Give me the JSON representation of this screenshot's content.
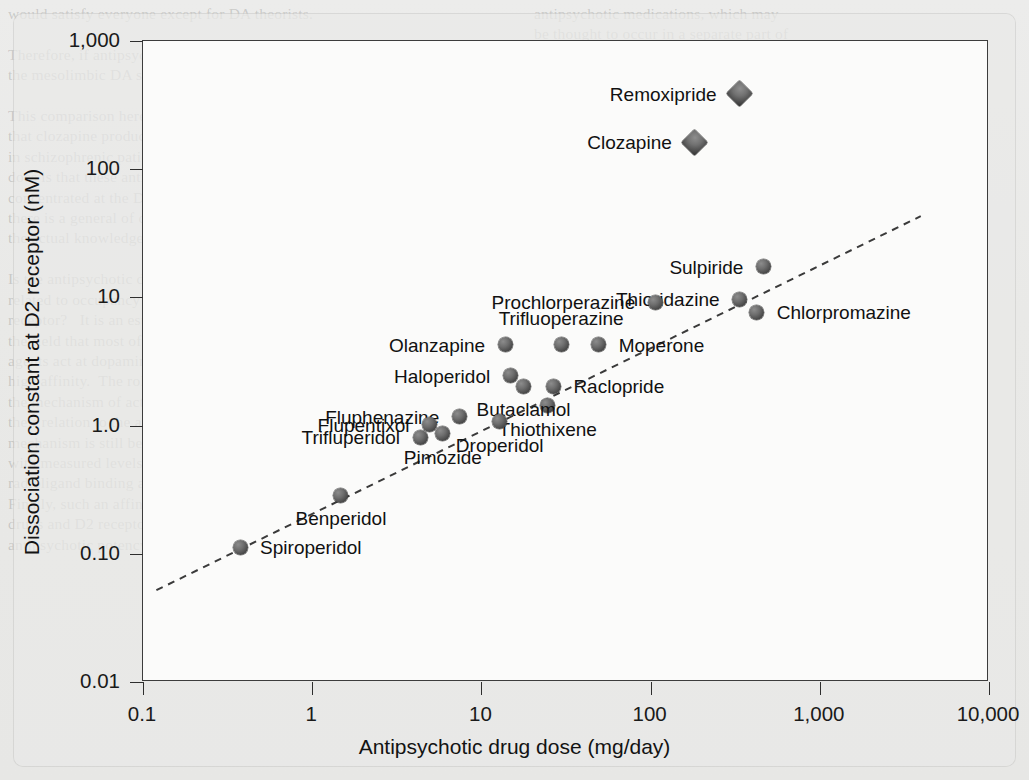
{
  "figure": {
    "background_color": "#e9e9e7",
    "plot_background_color": "#fbfbfa",
    "axis_color": "#2e2e2e",
    "marker_color": "#4a4a4a"
  },
  "chart_data": {
    "type": "scatter",
    "title": "",
    "xlabel": "Antipsychotic drug dose (mg/day)",
    "ylabel": "Dissociation constant at D2 receptor (nM)",
    "xscale": "log",
    "yscale": "log",
    "xlim": [
      0.1,
      10000
    ],
    "ylim": [
      0.01,
      1000
    ],
    "grid": false,
    "legend": "none",
    "xticks": [
      "0.1",
      "1",
      "10",
      "100",
      "1,000",
      "10,000"
    ],
    "xtick_values": [
      0.1,
      1,
      10,
      100,
      1000,
      10000
    ],
    "yticks": [
      "1,000",
      "100",
      "10",
      "1.0",
      "0.10",
      "0.01"
    ],
    "ytick_values": [
      1000,
      100,
      10,
      1.0,
      0.1,
      0.01
    ],
    "annotations": [
      {
        "name": "regression-line",
        "style": "dashed",
        "x0": 0.12,
        "y0": 0.052,
        "x1": 3950,
        "y1": 43
      }
    ],
    "points": [
      {
        "label": "Remoxipride",
        "x": 340,
        "y": 380,
        "marker": "diamond",
        "label_pos": "left"
      },
      {
        "label": "Clozapine",
        "x": 185,
        "y": 160,
        "marker": "diamond",
        "label_pos": "left"
      },
      {
        "label": "Sulpiride",
        "x": 470,
        "y": 17,
        "marker": "circle",
        "label_pos": "left"
      },
      {
        "label": "Thioridazine",
        "x": 340,
        "y": 9.5,
        "marker": "circle",
        "label_pos": "left"
      },
      {
        "label": "Chlorpromazine",
        "x": 430,
        "y": 7.5,
        "marker": "circle",
        "label_pos": "right"
      },
      {
        "label": "Prochlorperazine",
        "x": 108,
        "y": 9.0,
        "marker": "circle",
        "label_pos": "left"
      },
      {
        "label": "Moperone",
        "x": 50,
        "y": 4.2,
        "marker": "circle",
        "label_pos": "right"
      },
      {
        "label": "Trifluoperazine",
        "x": 30,
        "y": 4.2,
        "marker": "circle",
        "label_pos": "above"
      },
      {
        "label": "Olanzapine",
        "x": 14,
        "y": 4.2,
        "marker": "circle",
        "label_pos": "left"
      },
      {
        "label": "Raclopride",
        "x": 27,
        "y": 2.0,
        "marker": "circle",
        "label_pos": "right"
      },
      {
        "label": "Thiothixene",
        "x": 25,
        "y": 1.4,
        "marker": "circle",
        "label_pos": "below"
      },
      {
        "label": "Haloperidol",
        "x": 15,
        "y": 2.4,
        "marker": "circle",
        "label_pos": "left"
      },
      {
        "label": "Butaclamol",
        "x": 18,
        "y": 2.0,
        "marker": "circle",
        "label_pos": "below"
      },
      {
        "label": "Droperidol",
        "x": 13,
        "y": 1.05,
        "marker": "circle",
        "label_pos": "below"
      },
      {
        "label": "Fluphenazine",
        "x": 7.5,
        "y": 1.15,
        "marker": "circle",
        "label_pos": "left"
      },
      {
        "label": "Flupentixol",
        "x": 5.0,
        "y": 1.0,
        "marker": "circle",
        "label_pos": "left"
      },
      {
        "label": "Pimozide",
        "x": 6.0,
        "y": 0.85,
        "marker": "circle",
        "label_pos": "below"
      },
      {
        "label": "Trifluperidol",
        "x": 4.4,
        "y": 0.8,
        "marker": "circle",
        "label_pos": "left"
      },
      {
        "label": "Benperidol",
        "x": 1.5,
        "y": 0.28,
        "marker": "circle",
        "label_pos": "below"
      },
      {
        "label": "Spiroperidol",
        "x": 0.38,
        "y": 0.11,
        "marker": "circle",
        "label_pos": "right"
      }
    ]
  },
  "page_text": {
    "left_column": "would satisfy everyone except for DA theorists.\n\nTherefore, if antipsychotic drugs do not work through\nthe mesolimbic DA system, how do they work?\n\nThis comparison here does suggest\nthat clozapine produces and that it is\nin schizophrenic patient.  The reason above\ndoes is that these antipsychotic\nconcentrated at the D2 receptor and that\nthere is a general of drugs with\nthe actual knowledge of the D2 receptor.\n\nIs the antipsychotic drug effect\nrelated to occupancy of the dopamine D2\nreceptor?   It is an established consensus in\nthe field that most of the antipsychotic\nagents act at dopamine receptors with\nhigh affinity.  The role of D2 in\nthe mechanism of action of the drugs and\ntheir relation to the antipsychotic\nmechanism is still being studied,\nwith measured levels of\nradioligand binding at the receptors.\nFinally, such an affinity of these\ndrugs and D2 receptor blockade with\nantipsychotic potency is important for\n",
    "right_column": "antipsychotic medications, which may\nbe thought to occur in a separate part of\nthe brain.  The mesolimbic system and its\ndopamine in the ventral striatum/nucleus accumbens\nappears to be a central system, or the\nhypothesis that antipsychotic drugs\nare acting within a mesolimbic DA\nsystem, and may be the key to this action.\n\nThis conclusion is supported by\nthe receptor.  PET studies of the\nmechanisms of schizophrenia.  Evidence is\nweak in based how in the dopamine to the\nstriatal area and major involvement of the\nprimarily the prefrontal cortex.  Because\nit is responsible for perception, planning\nand more, the hypothesis has been advanced\nthat the system plays a role in the cause of\npsychosis.\n\nEvidence implicating DA in the main\nmechanism of antipsychotic drug action\n"
  }
}
